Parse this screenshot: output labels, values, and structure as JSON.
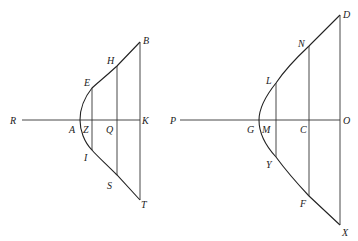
{
  "diagrams": [
    {
      "name": "left-hyperbola-figure",
      "labels": {
        "R": "R",
        "A": "A",
        "Z": "Z",
        "Q": "Q",
        "K": "K",
        "E": "E",
        "H": "H",
        "B": "B",
        "I": "I",
        "S": "S",
        "T": "T"
      }
    },
    {
      "name": "right-hyperbola-figure",
      "labels": {
        "P": "P",
        "G": "G",
        "M": "M",
        "C": "C",
        "O": "O",
        "L": "L",
        "N": "N",
        "D": "D",
        "Y": "Y",
        "F": "F",
        "X": "X"
      }
    }
  ],
  "colors": {
    "line": "#333333",
    "background": "#ffffff"
  }
}
